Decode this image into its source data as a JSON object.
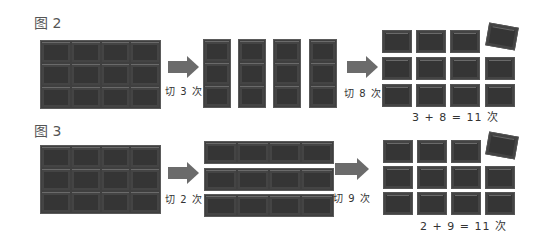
{
  "figure2": {
    "label": "图 2",
    "step1_note": "切 3 次",
    "step2_note": "切 8 次",
    "total": "3 + 8 = 11 次"
  },
  "figure3": {
    "label": "图 3",
    "step1_note": "切 2 次",
    "step2_note": "切 9 次",
    "total": "2 + 9 = 11 次"
  },
  "colors": {
    "chocolate": "#353535",
    "arrow": "#6b6b6b"
  }
}
